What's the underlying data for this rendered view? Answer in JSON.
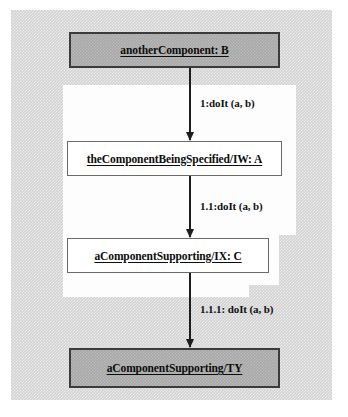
{
  "diagram": {
    "type": "uml-sequence-diagram",
    "background_color": "#d2d2d2",
    "inner_region_color": "#fdfdfd",
    "object_fill_gray": "#a8a8a8",
    "object_fill_white": "#ffffff",
    "line_color": "#1c1c1c",
    "objects": [
      {
        "id": "another-component-b",
        "label": "anotherComponent: B",
        "style": "solid",
        "underlined": true
      },
      {
        "id": "the-component-being-specified-iw-a",
        "label": "theComponentBeingSpecified/IW: A",
        "style": "hollow",
        "underlined": true
      },
      {
        "id": "a-component-supporting-ix-c",
        "label": "aComponentSupporting/IX: C",
        "style": "hollow",
        "underlined": true
      },
      {
        "id": "a-component-supporting-ty",
        "label": "aComponentSupporting/TY",
        "style": "solid",
        "underlined": true
      }
    ],
    "messages": [
      {
        "id": "message-1",
        "sequence": "1",
        "label": "1:doIt (a, b)",
        "from": "another-component-b",
        "to": "the-component-being-specified-iw-a",
        "direction": "down"
      },
      {
        "id": "message-1-1",
        "sequence": "1.1",
        "label": "1.1:doIt (a, b)",
        "from": "the-component-being-specified-iw-a",
        "to": "a-component-supporting-ix-c",
        "direction": "down"
      },
      {
        "id": "message-1-1-1",
        "sequence": "1.1.1",
        "label": "1.1.1: doIt (a, b)",
        "from": "a-component-supporting-ix-c",
        "to": "a-component-supporting-ty",
        "direction": "down"
      }
    ]
  }
}
